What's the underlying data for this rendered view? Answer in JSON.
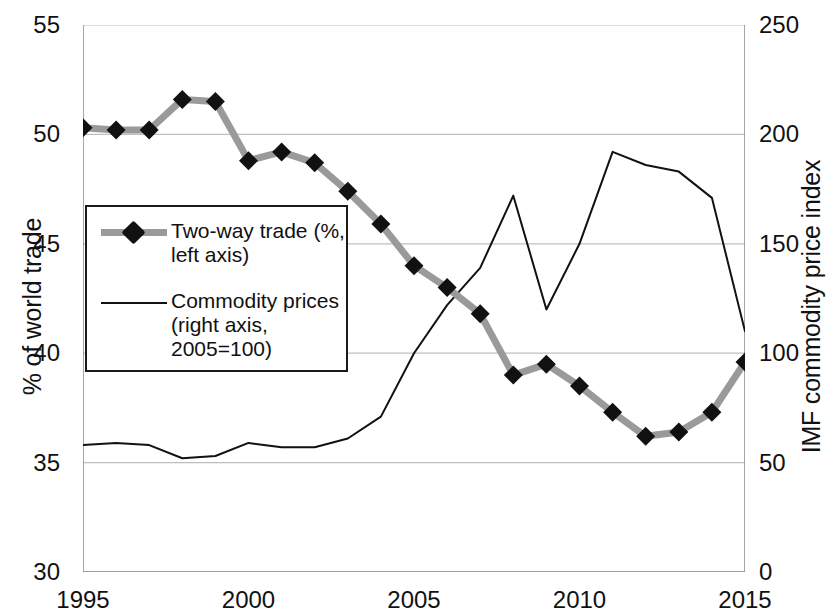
{
  "chart_data": {
    "type": "line",
    "title": "",
    "xlabel": "",
    "ylabel": "% of world trade",
    "y2label": "IMF commodity price index",
    "x": [
      1995,
      1996,
      1997,
      1998,
      1999,
      2000,
      2001,
      2002,
      2003,
      2004,
      2005,
      2006,
      2007,
      2008,
      2009,
      2010,
      2011,
      2012,
      2013,
      2014,
      2015
    ],
    "xlim": [
      1995,
      2015
    ],
    "xticks": [
      1995,
      1996,
      1997,
      1998,
      1999,
      2000,
      2001,
      2002,
      2003,
      2004,
      2005,
      2006,
      2007,
      2008,
      2009,
      2010,
      2011,
      2012,
      2013,
      2014,
      2015
    ],
    "xtick_labels": [
      "1995",
      "",
      "",
      "",
      "",
      "2000",
      "",
      "",
      "",
      "",
      "2005",
      "",
      "",
      "",
      "",
      "2010",
      "",
      "",
      "",
      "",
      "2015"
    ],
    "ylim": [
      30,
      55
    ],
    "yticks": [
      30,
      35,
      40,
      45,
      50,
      55
    ],
    "ytick_labels": [
      "30",
      "35",
      "40",
      "45",
      "50",
      "55"
    ],
    "y2lim": [
      0,
      250
    ],
    "y2ticks": [
      0,
      50,
      100,
      150,
      200,
      250
    ],
    "y2tick_labels": [
      "0",
      "50",
      "100",
      "150",
      "200",
      "250"
    ],
    "grid": "horizontal",
    "legend_position": "center-left",
    "series": [
      {
        "name": "Two-way trade (%, left axis)",
        "axis": "left",
        "style": "thick-grey-line-black-diamond-markers",
        "color": "#9a9a9a",
        "marker_color": "#111111",
        "values": [
          50.3,
          50.2,
          50.2,
          51.6,
          51.5,
          48.8,
          49.2,
          48.7,
          47.4,
          45.9,
          44.0,
          43.0,
          41.8,
          39.0,
          39.5,
          38.5,
          37.3,
          36.2,
          36.4,
          37.3,
          39.6
        ]
      },
      {
        "name": "Commodity prices (right axis, 2005=100)",
        "axis": "right",
        "style": "thin-black-line",
        "color": "#111111",
        "values": [
          58,
          59,
          58,
          52,
          53,
          59,
          57,
          57,
          61,
          71,
          100,
          122,
          139,
          172,
          120,
          150,
          192,
          186,
          183,
          171,
          110
        ]
      }
    ]
  },
  "legend": {
    "entries": [
      {
        "label": "Two-way trade (%,\nleft axis)",
        "key": "thick-grey-line-with-diamond"
      },
      {
        "label": "Commodity prices\n(right axis,\n2005=100)",
        "key": "thin-black-line"
      }
    ]
  },
  "colors": {
    "trade_line": "#9a9a9a",
    "trade_marker": "#111111",
    "commodity_line": "#111111",
    "gridline": "#bfbfbf",
    "axis": "#808080",
    "text": "#111111",
    "background": "#ffffff"
  }
}
